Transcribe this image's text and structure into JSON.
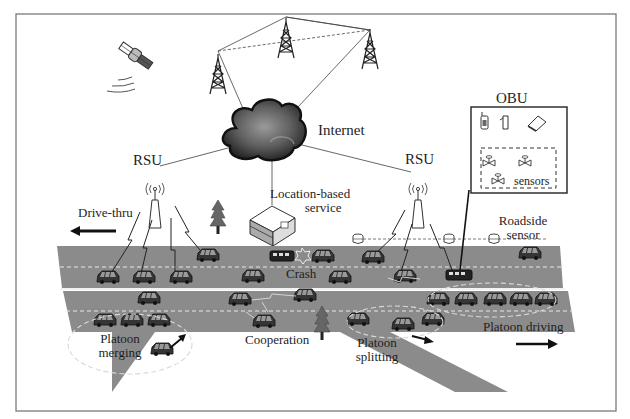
{
  "diagram": {
    "type": "vehicular-network-architecture",
    "frame": {
      "border_color": "#7a7a7a"
    },
    "colors": {
      "road": "#8a8a8a",
      "road_dark": "#7c7c7c",
      "lane_dash": "#e6e6e6",
      "divider": "#f4f4f4",
      "car": "#3a3a3a",
      "cloud": "#3d3d3d",
      "line": "#555555"
    },
    "labels": {
      "internet": "Internet",
      "rsu_left": "RSU",
      "rsu_right": "RSU",
      "obu": "OBU",
      "sensors": "sensors",
      "location_service_line1": "Location-based",
      "location_service_line2": "service",
      "drive_thru": "Drive-thru",
      "roadside_sensor_line1": "Roadside",
      "roadside_sensor_line2": "sensor",
      "crash": "Crash",
      "platoon_merging_line1": "Platoon",
      "platoon_merging_line2": "merging",
      "cooperation": "Cooperation",
      "platoon_splitting_line1": "Platoon",
      "platoon_splitting_line2": "splitting",
      "platoon_driving": "Platoon driving"
    },
    "nodes": [
      {
        "id": "satellite",
        "kind": "satellite-icon"
      },
      {
        "id": "tower-1",
        "kind": "cell-tower-icon"
      },
      {
        "id": "tower-2",
        "kind": "cell-tower-icon"
      },
      {
        "id": "tower-3",
        "kind": "cell-tower-icon"
      },
      {
        "id": "internet",
        "kind": "cloud-icon"
      },
      {
        "id": "rsu-left",
        "kind": "rsu-antenna-icon"
      },
      {
        "id": "rsu-right",
        "kind": "rsu-antenna-icon"
      },
      {
        "id": "location-server",
        "kind": "server-icon"
      },
      {
        "id": "obu",
        "kind": "obu-box"
      },
      {
        "id": "roadside-sensors",
        "kind": "roadside-sensor-icon",
        "count": 3
      }
    ],
    "obu_devices": [
      "mobile-phone-icon",
      "pda-icon",
      "laptop-icon"
    ],
    "obu_sensors": 3,
    "scenarios": [
      "Drive-thru",
      "Crash",
      "Platoon merging",
      "Cooperation",
      "Platoon splitting",
      "Platoon driving"
    ]
  }
}
